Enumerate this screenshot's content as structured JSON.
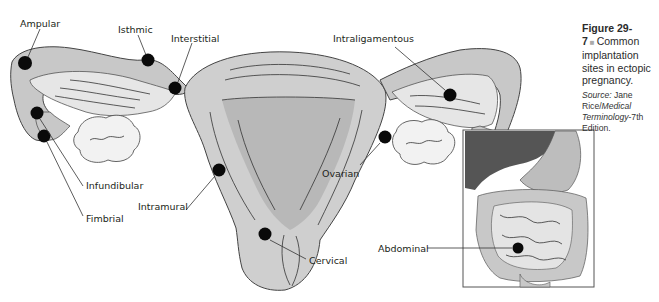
{
  "figure": {
    "number": "Figure 29-7",
    "separator": "■",
    "caption": "Common implantation sites in ectopic pregnancy.",
    "source_label": "Source:",
    "source_author": "Jane Rice/",
    "source_title": "Medical Terminology",
    "source_edition": "-7th Edition."
  },
  "labels": {
    "ampular": "Ampular",
    "isthmic": "Isthmic",
    "interstitial": "Interstitial",
    "intraligamentous": "Intraligamentous",
    "infundibular": "Infundibular",
    "fimbrial": "Fimbrial",
    "intramural": "Intramural",
    "ovarian": "Ovarian",
    "cervical": "Cervical",
    "abdominal": "Abdominal"
  },
  "colors": {
    "tissue_light": "#d9d9d9",
    "tissue_mid": "#bdbdbd",
    "liver": "#555555",
    "site_dot": "#0a0a0a"
  }
}
